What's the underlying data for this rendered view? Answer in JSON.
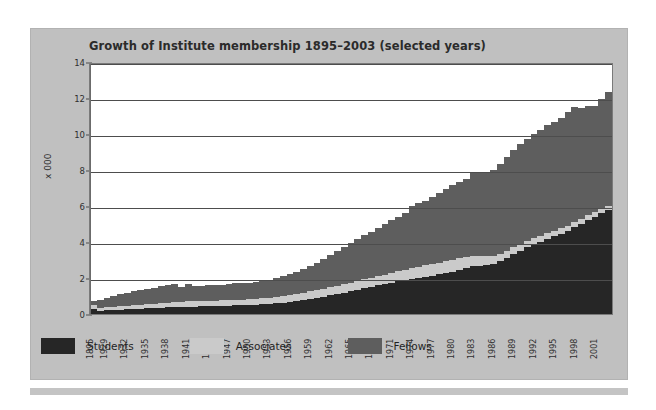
{
  "chart_title": "Growth of Institute membership 1895–2003 (selected years)",
  "axis": {
    "ylabel": "x 000",
    "yticks": [
      "0",
      "2",
      "4",
      "6",
      "8",
      "10",
      "12",
      "14"
    ],
    "xtick_labels": [
      "1895",
      "1929",
      "1932",
      "1935",
      "1938",
      "1941",
      "1944",
      "1947",
      "1950",
      "1953",
      "1956",
      "1959",
      "1962",
      "1965",
      "1968",
      "1971",
      "1974",
      "1977",
      "1980",
      "1983",
      "1986",
      "1989",
      "1992",
      "1995",
      "1998",
      "2001"
    ]
  },
  "legend": {
    "items": [
      {
        "label": "Students",
        "color": "#262626"
      },
      {
        "label": "Associates",
        "color": "#cacaca"
      },
      {
        "label": "Fellows",
        "color": "#5e5e5e"
      }
    ]
  },
  "colors": {
    "panel": "#c0c0c0",
    "plot_bg": "#ffffff",
    "gridline": "#4d4d4d",
    "students": "#262626",
    "associates": "#cacaca",
    "fellows": "#5e5e5e"
  },
  "chart_data": {
    "type": "area",
    "title": "Growth of Institute membership 1895–2003 (selected years)",
    "xlabel": "",
    "ylabel": "x 000",
    "ylim": [
      0,
      14
    ],
    "ytick_step": 2,
    "grid": true,
    "legend_position": "bottom-left",
    "stacked": true,
    "units": "thousands",
    "note": "Values are stacked: Students (bottom) + Associates (middle) + Fellows (top). Totals are the top of the stack.",
    "x": [
      1895,
      1928,
      1929,
      1930,
      1931,
      1932,
      1933,
      1934,
      1935,
      1936,
      1937,
      1938,
      1939,
      1940,
      1941,
      1942,
      1943,
      1944,
      1945,
      1946,
      1947,
      1948,
      1949,
      1950,
      1951,
      1952,
      1953,
      1954,
      1955,
      1956,
      1957,
      1958,
      1959,
      1960,
      1961,
      1962,
      1963,
      1964,
      1965,
      1966,
      1967,
      1968,
      1969,
      1970,
      1971,
      1972,
      1973,
      1974,
      1975,
      1976,
      1977,
      1978,
      1979,
      1980,
      1981,
      1982,
      1983,
      1984,
      1985,
      1986,
      1987,
      1988,
      1989,
      1990,
      1991,
      1992,
      1993,
      1994,
      1995,
      1996,
      1997,
      1998,
      1999,
      2000,
      2001,
      2002,
      2003
    ],
    "series": [
      {
        "name": "Students",
        "color": "#262626",
        "values": [
          0.3,
          0.18,
          0.2,
          0.22,
          0.24,
          0.26,
          0.28,
          0.3,
          0.32,
          0.34,
          0.36,
          0.38,
          0.4,
          0.41,
          0.42,
          0.42,
          0.43,
          0.44,
          0.45,
          0.46,
          0.47,
          0.48,
          0.49,
          0.5,
          0.52,
          0.54,
          0.56,
          0.6,
          0.64,
          0.68,
          0.74,
          0.8,
          0.86,
          0.92,
          0.98,
          1.05,
          1.12,
          1.2,
          1.28,
          1.36,
          1.44,
          1.52,
          1.6,
          1.68,
          1.76,
          1.84,
          1.9,
          1.96,
          2.02,
          2.08,
          2.14,
          2.22,
          2.3,
          2.38,
          2.48,
          2.58,
          2.66,
          2.7,
          2.74,
          2.78,
          2.95,
          3.15,
          3.35,
          3.55,
          3.75,
          3.9,
          4.05,
          4.2,
          4.35,
          4.5,
          4.65,
          4.85,
          5.05,
          5.25,
          5.45,
          5.65,
          5.8
        ]
      },
      {
        "name": "Associates",
        "color": "#cacaca",
        "values": [
          0.18,
          0.16,
          0.17,
          0.18,
          0.19,
          0.2,
          0.21,
          0.22,
          0.23,
          0.24,
          0.25,
          0.26,
          0.27,
          0.27,
          0.28,
          0.28,
          0.28,
          0.29,
          0.29,
          0.3,
          0.3,
          0.31,
          0.31,
          0.32,
          0.33,
          0.34,
          0.35,
          0.36,
          0.37,
          0.38,
          0.39,
          0.4,
          0.42,
          0.43,
          0.44,
          0.45,
          0.46,
          0.47,
          0.48,
          0.49,
          0.5,
          0.51,
          0.52,
          0.53,
          0.54,
          0.56,
          0.58,
          0.6,
          0.62,
          0.64,
          0.66,
          0.66,
          0.66,
          0.65,
          0.63,
          0.6,
          0.56,
          0.52,
          0.48,
          0.44,
          0.42,
          0.4,
          0.38,
          0.36,
          0.34,
          0.33,
          0.32,
          0.31,
          0.3,
          0.3,
          0.29,
          0.29,
          0.28,
          0.28,
          0.27,
          0.27,
          0.26
        ]
      },
      {
        "name": "Fellows",
        "color": "#5e5e5e",
        "values": [
          0.22,
          0.46,
          0.53,
          0.6,
          0.67,
          0.72,
          0.78,
          0.82,
          0.86,
          0.9,
          0.94,
          0.98,
          1.0,
          0.85,
          1.0,
          0.88,
          0.86,
          0.88,
          0.86,
          0.88,
          0.92,
          0.94,
          0.92,
          0.9,
          0.92,
          0.95,
          1.0,
          1.04,
          1.1,
          1.18,
          1.25,
          1.32,
          1.4,
          1.52,
          1.66,
          1.8,
          1.95,
          2.1,
          2.22,
          2.34,
          2.46,
          2.58,
          2.7,
          2.82,
          2.94,
          3.06,
          3.18,
          3.5,
          3.55,
          3.62,
          3.75,
          3.9,
          4.05,
          4.18,
          4.3,
          4.4,
          4.7,
          4.7,
          4.75,
          4.85,
          5.05,
          5.25,
          5.45,
          5.6,
          5.7,
          5.85,
          5.95,
          6.05,
          6.1,
          6.2,
          6.35,
          6.45,
          6.2,
          6.1,
          5.95,
          6.1,
          6.4
        ]
      }
    ],
    "totals": [
      0.7,
      0.8,
      0.9,
      1.0,
      1.1,
      1.18,
      1.27,
      1.34,
      1.41,
      1.48,
      1.55,
      1.62,
      1.67,
      1.53,
      1.7,
      1.58,
      1.57,
      1.61,
      1.6,
      1.64,
      1.69,
      1.73,
      1.72,
      1.72,
      1.77,
      1.83,
      1.91,
      2.0,
      2.11,
      2.24,
      2.38,
      2.52,
      2.68,
      2.87,
      3.08,
      3.3,
      3.53,
      3.77,
      3.98,
      4.19,
      4.4,
      4.61,
      4.82,
      5.03,
      5.24,
      5.46,
      5.66,
      6.06,
      6.19,
      6.34,
      6.55,
      6.78,
      7.01,
      7.21,
      7.41,
      7.58,
      7.92,
      7.92,
      7.97,
      8.07,
      8.42,
      8.8,
      9.18,
      9.51,
      9.79,
      10.08,
      10.32,
      10.56,
      10.75,
      11.0,
      11.29,
      11.59,
      11.53,
      11.63,
      11.67,
      12.02,
      12.46
    ]
  }
}
